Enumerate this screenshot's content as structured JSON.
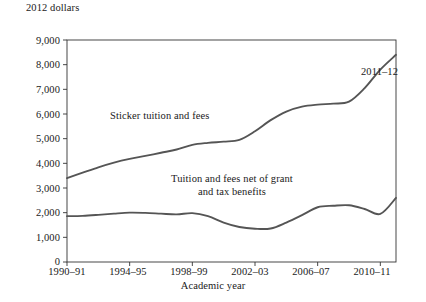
{
  "chart_data": {
    "type": "line",
    "title": "",
    "ylabel": "2012 dollars",
    "xlabel": "Academic year",
    "ylim": [
      0,
      9000
    ],
    "yticks": [
      "0",
      "1,000",
      "2,000",
      "3,000",
      "4,000",
      "5,000",
      "6,000",
      "7,000",
      "8,000",
      "9,000"
    ],
    "ytick_values": [
      0,
      1000,
      2000,
      3000,
      4000,
      5000,
      6000,
      7000,
      8000,
      9000
    ],
    "grid": false,
    "legend_position": "inline-annotations",
    "x": [
      "1990-91",
      "1991-92",
      "1992-93",
      "1993-94",
      "1994-95",
      "1995-96",
      "1996-97",
      "1997-98",
      "1998-99",
      "1999-00",
      "2000-01",
      "2001-02",
      "2002-03",
      "2003-04",
      "2004-05",
      "2005-06",
      "2006-07",
      "2007-08",
      "2008-09",
      "2009-10",
      "2010-11",
      "2011-12"
    ],
    "xticks": [
      "1990–91",
      "1994–95",
      "1998–99",
      "2002–03",
      "2006–07",
      "2010–11"
    ],
    "xtick_indices": [
      0,
      4,
      8,
      12,
      16,
      20
    ],
    "series": [
      {
        "name": "Sticker tuition and fees",
        "label": "Sticker tuition and fees",
        "color": "#555555",
        "values": [
          3400,
          3620,
          3840,
          4030,
          4180,
          4300,
          4430,
          4560,
          4750,
          4830,
          4880,
          4950,
          5300,
          5750,
          6100,
          6300,
          6380,
          6420,
          6500,
          7050,
          7800,
          8400
        ]
      },
      {
        "name": "Tuition and fees net of grant and tax benefits",
        "label_line1": "Tuition and fees net of grant",
        "label_line2": "and tax benefits",
        "color": "#555555",
        "values": [
          1860,
          1870,
          1910,
          1960,
          2000,
          1990,
          1960,
          1930,
          1980,
          1860,
          1600,
          1420,
          1350,
          1360,
          1600,
          1900,
          2220,
          2280,
          2300,
          2150,
          1950,
          2600
        ]
      }
    ],
    "annotations": [
      {
        "text": "2011–12",
        "target_series": "Sticker tuition and fees",
        "target_x": "2011-12"
      }
    ]
  },
  "axis": {
    "frame_color": "#333333",
    "line_color": "#555555"
  }
}
